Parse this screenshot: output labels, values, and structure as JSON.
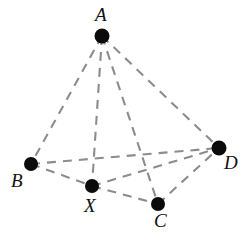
{
  "figure": {
    "name": "tetrahedron-with-interior-point",
    "background_color": "#ffffff",
    "edge_color": "#8c8c8c",
    "vertex_color": "#0b0b0b",
    "label_color": "#111111",
    "edge_style": "dashed",
    "width": 252,
    "height": 246
  },
  "vertices": [
    {
      "id": "A",
      "label": "A",
      "x": 102,
      "y": 36,
      "r": 7.5,
      "label_x": 95,
      "label_y": 5
    },
    {
      "id": "B",
      "label": "B",
      "x": 31,
      "y": 164,
      "r": 7.0,
      "label_x": 11,
      "label_y": 171
    },
    {
      "id": "C",
      "label": "C",
      "x": 158,
      "y": 204,
      "r": 7.0,
      "label_x": 154,
      "label_y": 211
    },
    {
      "id": "D",
      "label": "D",
      "x": 219,
      "y": 148,
      "r": 7.5,
      "label_x": 224,
      "label_y": 153
    },
    {
      "id": "X",
      "label": "X",
      "x": 92,
      "y": 186,
      "r": 7.0,
      "label_x": 84,
      "label_y": 196
    }
  ],
  "edges": [
    {
      "id": "AB",
      "from": "A",
      "to": "B",
      "dash": "9 7"
    },
    {
      "id": "AC",
      "from": "A",
      "to": "C",
      "dash": "9 7"
    },
    {
      "id": "AD",
      "from": "A",
      "to": "D",
      "dash": "9 7"
    },
    {
      "id": "AX",
      "from": "A",
      "to": "X",
      "dash": "9 7"
    },
    {
      "id": "BD",
      "from": "B",
      "to": "D",
      "dash": "9 7"
    },
    {
      "id": "BX",
      "from": "B",
      "to": "X",
      "dash": "9 7"
    },
    {
      "id": "XC",
      "from": "X",
      "to": "C",
      "dash": "9 7"
    },
    {
      "id": "XD",
      "from": "X",
      "to": "D",
      "dash": "9 7"
    },
    {
      "id": "CD",
      "from": "C",
      "to": "D",
      "dash": "9 7"
    }
  ]
}
